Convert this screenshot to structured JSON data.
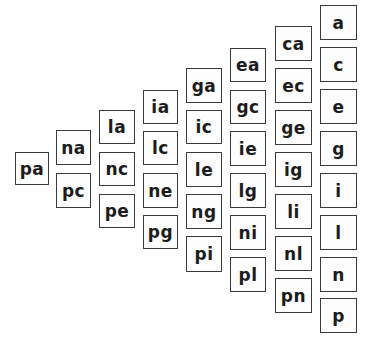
{
  "diagram": {
    "columns": [
      {
        "x": 15,
        "w": 34,
        "cards": [
          {
            "label": "pa",
            "y": 152,
            "h": 33
          }
        ]
      },
      {
        "x": 56,
        "w": 35,
        "cards": [
          {
            "label": "na",
            "y": 130,
            "h": 35
          },
          {
            "label": "pc",
            "y": 173,
            "h": 35
          }
        ]
      },
      {
        "x": 99,
        "w": 36,
        "cards": [
          {
            "label": "la",
            "y": 110,
            "h": 34
          },
          {
            "label": "nc",
            "y": 152,
            "h": 34
          },
          {
            "label": "pe",
            "y": 194,
            "h": 34
          }
        ]
      },
      {
        "x": 143,
        "w": 35,
        "cards": [
          {
            "label": "ia",
            "y": 90,
            "h": 34
          },
          {
            "label": "lc",
            "y": 131,
            "h": 34
          },
          {
            "label": "ne",
            "y": 173,
            "h": 35
          },
          {
            "label": "pg",
            "y": 215,
            "h": 34
          }
        ]
      },
      {
        "x": 186,
        "w": 36,
        "cards": [
          {
            "label": "ga",
            "y": 68,
            "h": 35
          },
          {
            "label": "ic",
            "y": 110,
            "h": 34
          },
          {
            "label": "le",
            "y": 152,
            "h": 35
          },
          {
            "label": "ng",
            "y": 194,
            "h": 35
          },
          {
            "label": "pi",
            "y": 236,
            "h": 36
          }
        ]
      },
      {
        "x": 230,
        "w": 36,
        "cards": [
          {
            "label": "ea",
            "y": 48,
            "h": 34
          },
          {
            "label": "gc",
            "y": 90,
            "h": 34
          },
          {
            "label": "ie",
            "y": 131,
            "h": 35
          },
          {
            "label": "lg",
            "y": 173,
            "h": 35
          },
          {
            "label": "ni",
            "y": 215,
            "h": 35
          },
          {
            "label": "pl",
            "y": 257,
            "h": 35
          }
        ]
      },
      {
        "x": 275,
        "w": 37,
        "cards": [
          {
            "label": "ca",
            "y": 26,
            "h": 35
          },
          {
            "label": "ec",
            "y": 68,
            "h": 35
          },
          {
            "label": "ge",
            "y": 110,
            "h": 35
          },
          {
            "label": "ig",
            "y": 152,
            "h": 35
          },
          {
            "label": "li",
            "y": 194,
            "h": 35
          },
          {
            "label": "nl",
            "y": 236,
            "h": 35
          },
          {
            "label": "pn",
            "y": 278,
            "h": 35
          }
        ]
      },
      {
        "x": 320,
        "w": 37,
        "cards": [
          {
            "label": "a",
            "y": 5,
            "h": 35
          },
          {
            "label": "c",
            "y": 47,
            "h": 35
          },
          {
            "label": "e",
            "y": 89,
            "h": 35
          },
          {
            "label": "g",
            "y": 131,
            "h": 35
          },
          {
            "label": "i",
            "y": 173,
            "h": 35
          },
          {
            "label": "l",
            "y": 215,
            "h": 35
          },
          {
            "label": "n",
            "y": 257,
            "h": 35
          },
          {
            "label": "p",
            "y": 298,
            "h": 35
          }
        ]
      }
    ]
  },
  "colors": {
    "background": "#ffffff",
    "border": "#3a3a3a",
    "text": "#1c1c1c"
  }
}
